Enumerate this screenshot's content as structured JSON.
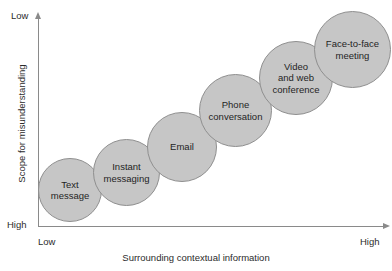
{
  "chart_data": {
    "type": "scatter",
    "title": "",
    "xlabel": "Surrounding contextual information",
    "ylabel": "Scope for misunderstanding",
    "x_axis_low_label": "Low",
    "x_axis_high_label": "High",
    "y_axis_low_label": "Low",
    "y_axis_high_label": "High",
    "grid": false,
    "legend": "none",
    "note": "Bubble size increases with richness of the communication channel; bubbles ascend from low-context/high-misunderstanding to high-context/low-misunderstanding.",
    "categories": [
      "Text message",
      "Instant messaging",
      "Email",
      "Phone conversation",
      "Video and web conference",
      "Face-to-face meeting"
    ],
    "points": [
      {
        "label_lines": [
          "Text",
          "message"
        ],
        "x": 1,
        "y": 1,
        "size": 1
      },
      {
        "label_lines": [
          "Instant",
          "messaging"
        ],
        "x": 2,
        "y": 2,
        "size": 2
      },
      {
        "label_lines": [
          "Email"
        ],
        "x": 3,
        "y": 3,
        "size": 3
      },
      {
        "label_lines": [
          "Phone",
          "conversation"
        ],
        "x": 4,
        "y": 4,
        "size": 4
      },
      {
        "label_lines": [
          "Video",
          "and web",
          "conference"
        ],
        "x": 5,
        "y": 5,
        "size": 5
      },
      {
        "label_lines": [
          "Face-to-face",
          "meeting"
        ],
        "x": 6,
        "y": 6,
        "size": 6
      }
    ],
    "bubbles": [
      {
        "name": "text-message",
        "line1": "Text",
        "line2": "message",
        "line3": "",
        "left": 38,
        "top": 158,
        "diameter": 64
      },
      {
        "name": "instant-messaging",
        "line1": "Instant",
        "line2": "messaging",
        "line3": "",
        "left": 93,
        "top": 139,
        "diameter": 67
      },
      {
        "name": "email",
        "line1": "Email",
        "line2": "",
        "line3": "",
        "left": 147,
        "top": 112,
        "diameter": 70
      },
      {
        "name": "phone-conversation",
        "line1": "Phone",
        "line2": "conversation",
        "line3": "",
        "left": 199,
        "top": 74,
        "diameter": 73
      },
      {
        "name": "video-web-conference",
        "line1": "Video",
        "line2": "and web",
        "line3": "conference",
        "left": 259,
        "top": 41,
        "diameter": 74
      },
      {
        "name": "face-to-face-meeting",
        "line1": "Face-to-face",
        "line2": "meeting",
        "line3": "",
        "left": 314,
        "top": 11,
        "diameter": 77
      }
    ],
    "colors": {
      "bubble_fill": "#c6c6c6",
      "bubble_stroke": "#8f8f8f",
      "axis": "#8a8a8a",
      "text": "#1f1f1f",
      "background": "#ffffff"
    }
  }
}
